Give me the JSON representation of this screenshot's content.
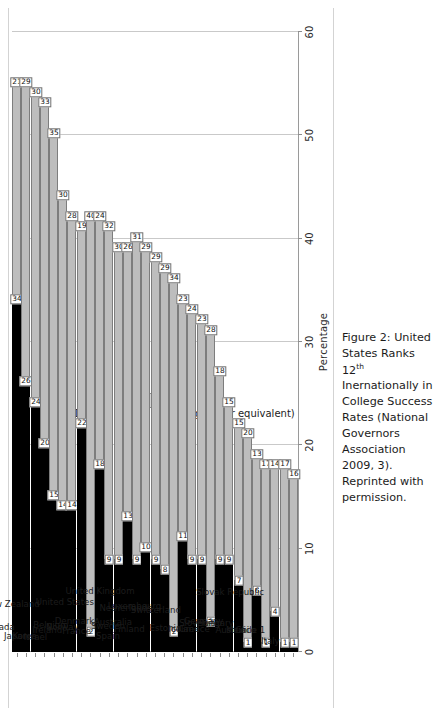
{
  "figure": {
    "caption_line1_a": "Figure 2: United States Ranks 12",
    "caption_sup": "th",
    "caption_line1_b": " Inernationally in College Success Rates",
    "caption_line2": "(National Governors Association 2009, 3). Reprinted with permission."
  },
  "legend": {
    "items": [
      {
        "label": "A.A. Degree",
        "color": "#000000",
        "key": "aa"
      },
      {
        "label": "B.A. Degree (or equivalent)",
        "color": "#d6d6d6",
        "key": "ba"
      }
    ]
  },
  "chart_data": {
    "type": "bar",
    "orientation": "horizontal-stacked",
    "title": "",
    "xlabel": "Percentage",
    "ylabel": "",
    "xlim": [
      0,
      60
    ],
    "xticks": [
      0,
      10,
      20,
      30,
      40,
      50,
      60
    ],
    "grid": true,
    "legend_position": "top-left",
    "categories": [
      "Russian Federation 1",
      "Canada",
      "Japan",
      "Korea",
      "Israel",
      "New Zealand",
      "Ireland",
      "Belgium",
      "Norway",
      "France",
      "Denmark",
      "United States",
      "Spain",
      "Sweden",
      "Australia",
      "Finland",
      "United Kingdom",
      "Netherlands",
      "Luxembourg",
      "Estonia",
      "Switzerland",
      "Iceland",
      "Greece",
      "Slovenia",
      "Germany",
      "Hungary",
      "Austria",
      "Mexico",
      "Chile 1",
      "Italy",
      "Slovak Republic"
    ],
    "series": [
      {
        "name": "A.A. Degree",
        "color": "#000000",
        "values": [
          34,
          26,
          24,
          20,
          15,
          14,
          14,
          22,
          2,
          18,
          9,
          9,
          13,
          9,
          10,
          9,
          8,
          2,
          11,
          9,
          9,
          3,
          9,
          9,
          7,
          1,
          6,
          1,
          4,
          1,
          1
        ]
      },
      {
        "name": "B.A. Degree (or equivalent)",
        "color": "#bdbdbd",
        "values": [
          21,
          29,
          30,
          33,
          35,
          30,
          28,
          19,
          40,
          24,
          32,
          30,
          26,
          31,
          29,
          29,
          29,
          34,
          23,
          24,
          23,
          28,
          18,
          15,
          15,
          20,
          13,
          17,
          14,
          17,
          16
        ]
      }
    ]
  }
}
